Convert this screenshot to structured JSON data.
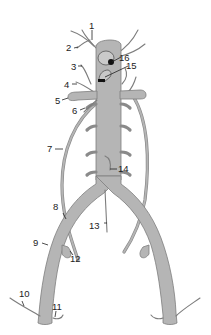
{
  "diagram": {
    "colors": {
      "vessel_fill": "#b5b5b5",
      "vessel_outline": "#7d7d7d",
      "label_text": "#222222",
      "background": "#ffffff",
      "marker_dark": "#111111"
    },
    "labels": [
      {
        "id": "1",
        "text": "1"
      },
      {
        "id": "2",
        "text": "2"
      },
      {
        "id": "3",
        "text": "3"
      },
      {
        "id": "4",
        "text": "4"
      },
      {
        "id": "5",
        "text": "5"
      },
      {
        "id": "6",
        "text": "6"
      },
      {
        "id": "7",
        "text": "7"
      },
      {
        "id": "8",
        "text": "8"
      },
      {
        "id": "9",
        "text": "9"
      },
      {
        "id": "10",
        "text": "10"
      },
      {
        "id": "11",
        "text": "11"
      },
      {
        "id": "12",
        "text": "12"
      },
      {
        "id": "13",
        "text": "13"
      },
      {
        "id": "14",
        "text": "14"
      },
      {
        "id": "15",
        "text": "15"
      },
      {
        "id": "16",
        "text": "16"
      }
    ]
  }
}
